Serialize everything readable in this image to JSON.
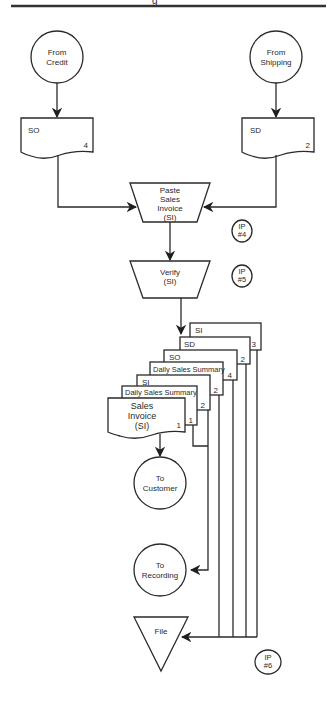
{
  "header": {
    "title_fragment": "g"
  },
  "sources": [
    {
      "id": "from-credit",
      "lines": [
        "From",
        "Credit"
      ]
    },
    {
      "id": "from-shipping",
      "lines": [
        "From",
        "Shipping"
      ]
    }
  ],
  "documents": {
    "so": {
      "label": "SO",
      "copy": "4"
    },
    "sd": {
      "label": "SD",
      "copy": "2"
    }
  },
  "processes": {
    "paste": {
      "lines": [
        "Paste",
        "Sales",
        "Invoice",
        "(SI)"
      ]
    },
    "verify": {
      "lines": [
        "Verify",
        "(SI)"
      ]
    }
  },
  "ip_markers": [
    {
      "lines": [
        "IP",
        "#4"
      ]
    },
    {
      "lines": [
        "IP",
        "#5"
      ]
    },
    {
      "lines": [
        "IP",
        "#6"
      ]
    }
  ],
  "output_stack": [
    {
      "label": "SI",
      "copy": "3"
    },
    {
      "label": "SD",
      "copy": "2"
    },
    {
      "label": "SO",
      "copy": "4"
    },
    {
      "label": "Daily Sales Summary",
      "copy": "2"
    },
    {
      "label": "SI",
      "copy": "2"
    },
    {
      "label": "Daily Sales Summary",
      "copy": "1"
    },
    {
      "label_lines": [
        "Sales",
        "Invoice",
        "(SI)"
      ],
      "copy": "1"
    }
  ],
  "destinations": {
    "customer": {
      "lines": [
        "To",
        "Customer"
      ]
    },
    "recording": {
      "lines": [
        "To",
        "Recording"
      ]
    },
    "file": {
      "label": "File"
    }
  }
}
